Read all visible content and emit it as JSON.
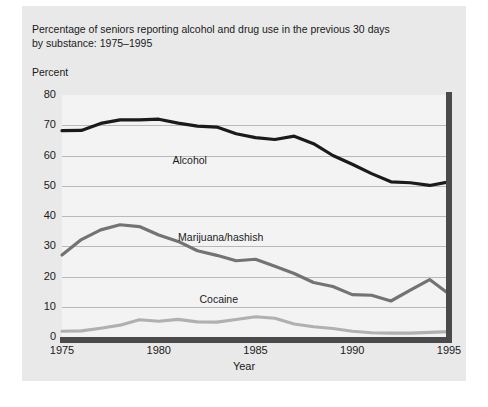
{
  "chart_data": {
    "type": "line",
    "title": "Percentage of seniors reporting alcohol and drug use in the previous 30 days by substance: 1975–1995",
    "title_line1": "Percentage of seniors reporting alcohol and drug use in the previous 30 days",
    "title_line2": "by substance: 1975–1995",
    "ylabel": "Percent",
    "xlabel": "Year",
    "xlim": [
      1975,
      1995
    ],
    "ylim": [
      0,
      80
    ],
    "yticks": [
      0,
      10,
      20,
      30,
      40,
      50,
      60,
      70,
      80
    ],
    "ytick_labels": [
      "0",
      "10",
      "20",
      "30",
      "40",
      "50",
      "60",
      "70",
      "80"
    ],
    "xticks": [
      1975,
      1980,
      1985,
      1990,
      1995
    ],
    "xtick_labels": [
      "1975",
      "1980",
      "1985",
      "1990",
      "1995"
    ],
    "minor_xticks": [
      1976,
      1977,
      1978,
      1979,
      1981,
      1982,
      1983,
      1984,
      1986,
      1987,
      1988,
      1989,
      1991,
      1992,
      1993,
      1994
    ],
    "grid": "horizontal",
    "legend_position": "inline-annotations",
    "x": [
      1975,
      1976,
      1977,
      1978,
      1979,
      1980,
      1981,
      1982,
      1983,
      1984,
      1985,
      1986,
      1987,
      1988,
      1989,
      1990,
      1991,
      1992,
      1993,
      1994,
      1995
    ],
    "series": [
      {
        "name": "Alcohol",
        "color": "#1a1a1a",
        "label_x": 1981.6,
        "label_y": 58.5,
        "values": [
          68.2,
          68.3,
          70.6,
          71.8,
          71.8,
          72.0,
          70.7,
          69.7,
          69.4,
          67.2,
          65.9,
          65.3,
          66.4,
          63.9,
          60.0,
          57.1,
          54.0,
          51.3,
          51.0,
          50.1,
          51.3
        ]
      },
      {
        "name": "Marijuana/hashish",
        "color": "#737373",
        "label_x": 1983.2,
        "label_y": 33.0,
        "values": [
          27.1,
          32.2,
          35.4,
          37.1,
          36.5,
          33.7,
          31.6,
          28.5,
          27.0,
          25.2,
          25.7,
          23.4,
          21.0,
          18.0,
          16.7,
          14.0,
          13.8,
          11.9,
          15.5,
          19.0,
          14.2
        ]
      },
      {
        "name": "Cocaine",
        "color": "#b0b0b0",
        "label_x": 1983.1,
        "label_y": 12.5,
        "values": [
          1.9,
          2.0,
          2.9,
          3.9,
          5.7,
          5.2,
          5.8,
          5.0,
          4.9,
          5.8,
          6.7,
          6.2,
          4.3,
          3.4,
          2.8,
          1.9,
          1.4,
          1.3,
          1.3,
          1.5,
          1.8
        ]
      }
    ]
  }
}
